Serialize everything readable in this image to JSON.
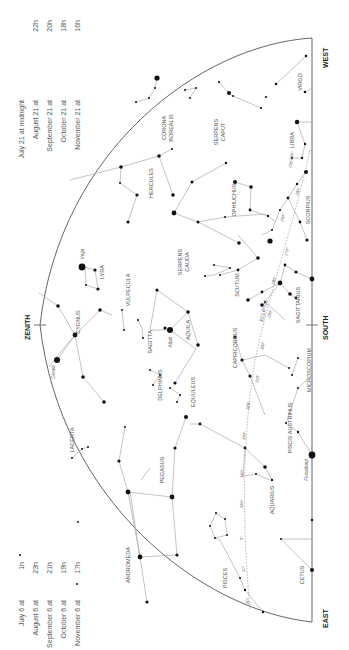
{
  "title_directions": {
    "west": "WEST",
    "east": "EAST",
    "south": "SOUTH",
    "zenith": "ZENITH",
    "ecliptic": "ECLIPTIC"
  },
  "times_top": [
    {
      "date": "July 21 at midnight",
      "hour": ""
    },
    {
      "date": "August 21 at",
      "hour": "22h"
    },
    {
      "date": "September 21 at",
      "hour": "20h"
    },
    {
      "date": "October 21 at",
      "hour": "18h"
    },
    {
      "date": "November 21 at",
      "hour": "16h"
    }
  ],
  "times_bottom": [
    {
      "date": "July 6 at",
      "hour": "1h"
    },
    {
      "date": "August 6 at",
      "hour": "23h"
    },
    {
      "date": "September 6 at",
      "hour": "21h"
    },
    {
      "date": "October 6 at",
      "hour": "19h"
    },
    {
      "date": "November 6 at",
      "hour": "17h"
    }
  ],
  "constellations": {
    "virgo": "VIRGO",
    "libra": "LIBRA",
    "scorpius": "SCORPIUS",
    "corona_borealis_1": "CORONA",
    "corona_borealis_2": "BOREALIS",
    "serpens_caput_1": "SERPENS",
    "serpens_caput_2": "CAPUT",
    "hercules": "HERCULES",
    "ophiuchus": "OPHIUCHUS",
    "lyra": "LYRA",
    "vulpecula": "VULPECULA",
    "serpens_cauda_1": "SERPENS",
    "serpens_cauda_2": "CAUDA",
    "scutum": "SCUTUM",
    "sagittarius": "SAGITTARIUS",
    "cygnus": "CYGNUS",
    "sagitta": "SAGITTA",
    "aquila": "AQUILA",
    "capricornus": "CAPRICORNUS",
    "microscopium": "MICROSCOPIUM",
    "delphinus": "DELPHINUS",
    "equuleus": "EQUULEUS",
    "lacerta": "LACERTA",
    "pegasus": "PEGASUS",
    "piscis_austrinus": "PISCIS AUSTRINUS",
    "aquarius": "AQUARIUS",
    "andromeda": "ANDROMEDA",
    "pisces": "PISCES",
    "cetus": "CETUS"
  },
  "stars": {
    "vega": "Vega",
    "deneb": "Deneb",
    "altair": "Altair",
    "fomalhaut": "Fomalhaut"
  },
  "ecliptic_degrees": [
    "230°",
    "240°",
    "250°",
    "260°",
    "270°",
    "280°",
    "290°",
    "300°",
    "310°",
    "320°",
    "330°",
    "340°",
    "350°",
    "0°",
    "10°",
    "20°"
  ]
}
